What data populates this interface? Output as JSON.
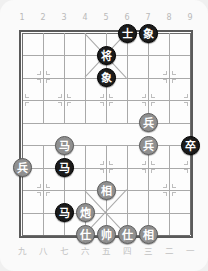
{
  "app": {
    "title": "Xiangqi Board",
    "background_color": "#fafafa",
    "board_color": "#fdfdfd",
    "line_color": "#a9a9a9",
    "border_color": "#5a5a5a",
    "black_piece_color": "#1b1b1b",
    "red_piece_color": "#8f8f8f"
  },
  "board": {
    "files": 9,
    "ranks": 10,
    "top_labels": [
      "1",
      "2",
      "3",
      "4",
      "5",
      "6",
      "7",
      "8",
      "9"
    ],
    "bottom_labels": [
      "九",
      "八",
      "七",
      "六",
      "五",
      "四",
      "三",
      "二",
      "一"
    ],
    "river_present": true,
    "palace_top": {
      "files": [
        4,
        6
      ],
      "ranks": [
        0,
        2
      ]
    },
    "palace_bottom": {
      "files": [
        4,
        6
      ],
      "ranks": [
        7,
        9
      ]
    },
    "star_points": [
      {
        "file": 2,
        "rank": 2
      },
      {
        "file": 8,
        "rank": 2
      },
      {
        "file": 1,
        "rank": 3
      },
      {
        "file": 3,
        "rank": 3
      },
      {
        "file": 5,
        "rank": 3
      },
      {
        "file": 7,
        "rank": 3
      },
      {
        "file": 9,
        "rank": 3
      },
      {
        "file": 1,
        "rank": 6
      },
      {
        "file": 3,
        "rank": 6
      },
      {
        "file": 5,
        "rank": 6
      },
      {
        "file": 7,
        "rank": 6
      },
      {
        "file": 9,
        "rank": 6
      },
      {
        "file": 2,
        "rank": 7
      },
      {
        "file": 8,
        "rank": 7
      }
    ],
    "pieces": [
      {
        "id": "p1",
        "label": "士",
        "side": "black",
        "file": 6,
        "rank": 0
      },
      {
        "id": "p2",
        "label": "象",
        "side": "black",
        "file": 7,
        "rank": 0
      },
      {
        "id": "p3",
        "label": "将",
        "side": "black",
        "file": 5,
        "rank": 1
      },
      {
        "id": "p4",
        "label": "象",
        "side": "black",
        "file": 5,
        "rank": 2
      },
      {
        "id": "p5",
        "label": "兵",
        "side": "red",
        "file": 7,
        "rank": 4
      },
      {
        "id": "p6",
        "label": "马",
        "side": "red",
        "file": 3,
        "rank": 5
      },
      {
        "id": "p7",
        "label": "兵",
        "side": "red",
        "file": 7,
        "rank": 5
      },
      {
        "id": "p8",
        "label": "卒",
        "side": "black",
        "file": 9,
        "rank": 5
      },
      {
        "id": "p9",
        "label": "兵",
        "side": "red",
        "file": 1,
        "rank": 6
      },
      {
        "id": "p10",
        "label": "马",
        "side": "black",
        "file": 3,
        "rank": 6
      },
      {
        "id": "p11",
        "label": "相",
        "side": "red",
        "file": 5,
        "rank": 7
      },
      {
        "id": "p12",
        "label": "马",
        "side": "black",
        "file": 3,
        "rank": 8
      },
      {
        "id": "p13",
        "label": "炮",
        "side": "red",
        "file": 4,
        "rank": 8
      },
      {
        "id": "p14",
        "label": "仕",
        "side": "red",
        "file": 4,
        "rank": 9
      },
      {
        "id": "p15",
        "label": "帅",
        "side": "red",
        "file": 5,
        "rank": 9
      },
      {
        "id": "p16",
        "label": "仕",
        "side": "red",
        "file": 6,
        "rank": 9
      },
      {
        "id": "p17",
        "label": "相",
        "side": "red",
        "file": 7,
        "rank": 9
      }
    ]
  }
}
